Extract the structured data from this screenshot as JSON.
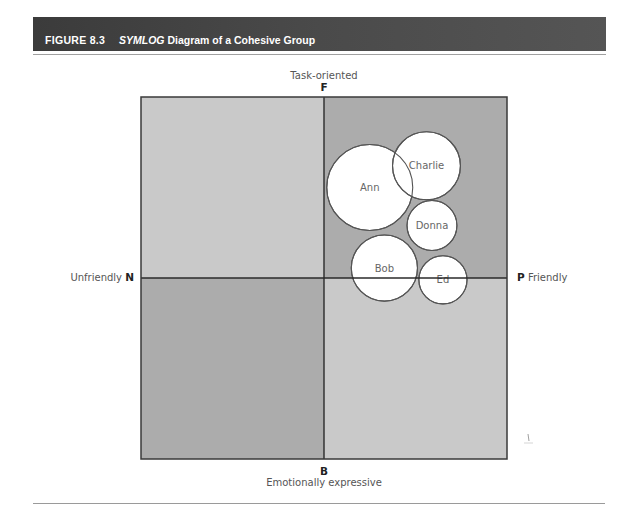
{
  "figure": {
    "number": "FIGURE 8.3",
    "title_italic": "SYMLOG",
    "title_rest": " Diagram of a Cohesive Group"
  },
  "axes": {
    "top": {
      "letter": "F",
      "label": "Task-oriented"
    },
    "bottom": {
      "letter": "B",
      "label": "Emotionally expressive"
    },
    "left": {
      "letter": "N",
      "label": "Unfriendly"
    },
    "right": {
      "letter": "P",
      "label": "Friendly"
    }
  },
  "colors": {
    "banner": "#444444",
    "quadrant_light": "#c9c9c9",
    "quadrant_dark": "#acacac",
    "axis_line": "#2a2a2a",
    "circle_fill": "#ffffff",
    "circle_stroke": "#555555",
    "member_text": "#666666"
  },
  "members": [
    {
      "name": "Ann",
      "x": 0.25,
      "y": 0.5,
      "size": 1.0
    },
    {
      "name": "Charlie",
      "x": 0.56,
      "y": 0.62,
      "size": 0.79
    },
    {
      "name": "Donna",
      "x": 0.59,
      "y": 0.29,
      "size": 0.58
    },
    {
      "name": "Bob",
      "x": 0.33,
      "y": 0.055,
      "size": 0.77
    },
    {
      "name": "Ed",
      "x": 0.65,
      "y": -0.01,
      "size": 0.56
    }
  ]
}
